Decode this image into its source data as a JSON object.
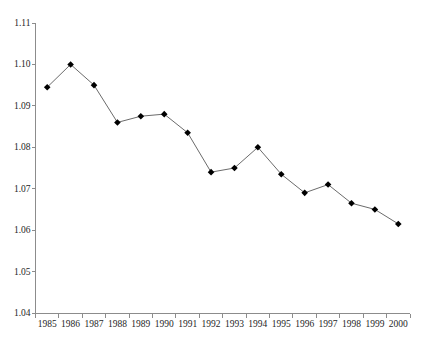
{
  "figure": {
    "background": "#ffffff",
    "width": 426,
    "height": 347
  },
  "chart_data": {
    "type": "line",
    "title": "",
    "xlabel": "",
    "ylabel": "",
    "categories": [
      "1985",
      "1986",
      "1987",
      "1988",
      "1989",
      "1990",
      "1991",
      "1992",
      "1993",
      "1994",
      "1995",
      "1996",
      "1997",
      "1998",
      "1999",
      "2000"
    ],
    "series": [
      {
        "name": "ratio-series",
        "values": [
          1.0945,
          1.1,
          1.095,
          1.086,
          1.0875,
          1.088,
          1.0835,
          1.074,
          1.075,
          1.08,
          1.0735,
          1.069,
          1.071,
          1.0665,
          1.065,
          1.0615
        ]
      }
    ],
    "ylim": [
      1.04,
      1.11
    ],
    "ytick_values": [
      1.04,
      1.05,
      1.06,
      1.07,
      1.08,
      1.09,
      1.1,
      1.11
    ],
    "ytick_labels": [
      "1.04",
      "1.05",
      "1.06",
      "1.07",
      "1.08",
      "1.09",
      "1.10",
      "1.11"
    ],
    "grid": false,
    "legend": "none",
    "marker": "diamond",
    "colors": {
      "line": "#6b6b6b",
      "marker": "#000000",
      "axis": "#8c8c8c",
      "text": "#262626",
      "background": "#ffffff"
    }
  }
}
